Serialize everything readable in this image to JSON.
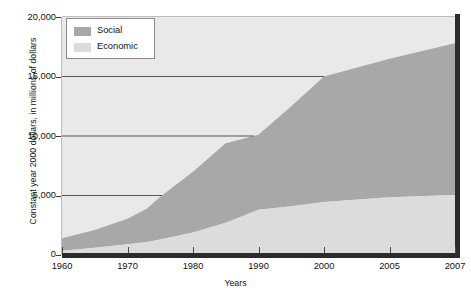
{
  "chart_data": {
    "type": "area",
    "title": "",
    "subtitle": "",
    "xlabel": "Years",
    "ylabel": "Constant year 2000 dollars, in millions of dollars",
    "stacked": true,
    "grid": true,
    "grid_note": "horizontal gridlines at 5,000 / 10,000 / 15,000 truncated where they intersect the stacked area",
    "legend_position": "top-left-inside",
    "ylim": [
      0,
      20000
    ],
    "ytick_labels": [
      "20,000",
      "15,000",
      "10,000",
      "5,000",
      "0"
    ],
    "ytick_values": [
      20000,
      15000,
      10000,
      5000,
      0
    ],
    "xtick_labels": [
      "1960",
      "1970",
      "1980",
      "1990",
      "2000",
      "2005",
      "2007"
    ],
    "xtick_values": [
      1960,
      1970,
      1980,
      1990,
      2000,
      2005,
      2007
    ],
    "x_axis_note": "category-style axis: ticks evenly spaced although year intervals differ",
    "x": [
      1960,
      1965,
      1970,
      1973,
      1975,
      1980,
      1985,
      1990,
      1995,
      2000,
      2005,
      2007
    ],
    "series": [
      {
        "name": "Economic",
        "color": "#dcdcdc",
        "values": [
          350,
          600,
          900,
          1100,
          1300,
          1900,
          2700,
          3800,
          4100,
          4450,
          4850,
          5050
        ]
      },
      {
        "name": "Social",
        "color": "#a8a8a8",
        "values": [
          1050,
          1500,
          2150,
          2800,
          3600,
          5100,
          6700,
          6300,
          8400,
          10550,
          11650,
          12750
        ]
      }
    ],
    "totals": [
      1400,
      2100,
      3050,
      3900,
      4900,
      7000,
      9400,
      10100,
      12500,
      15000,
      16500,
      17800
    ],
    "colors": {
      "plot_background": "#e9e9e9",
      "social": "#a8a8a8",
      "economic": "#dcdcdc",
      "axis": "#2b2b2b",
      "gridline": "#555555",
      "text": "#111111",
      "legend_background": "#ffffff",
      "legend_border": "#8a8a8a"
    }
  },
  "legend": {
    "items": [
      {
        "label": "Social",
        "color": "#a8a8a8"
      },
      {
        "label": "Economic",
        "color": "#dcdcdc"
      }
    ]
  }
}
